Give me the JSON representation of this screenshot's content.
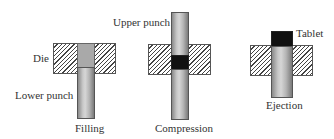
{
  "diagram": {
    "stages": [
      {
        "id": "filling",
        "caption": "Filling"
      },
      {
        "id": "compression",
        "caption": "Compression"
      },
      {
        "id": "ejection",
        "caption": "Ejection"
      }
    ],
    "labels": {
      "die": "Die",
      "lower_punch": "Lower punch",
      "upper_punch": "Upper punch",
      "tablet": "Tablet"
    },
    "colors": {
      "die_hatch": "#444444",
      "punch": "#b5b5b5",
      "powder": "#a9a9a9",
      "tablet": "#111111",
      "text": "#333333"
    }
  }
}
